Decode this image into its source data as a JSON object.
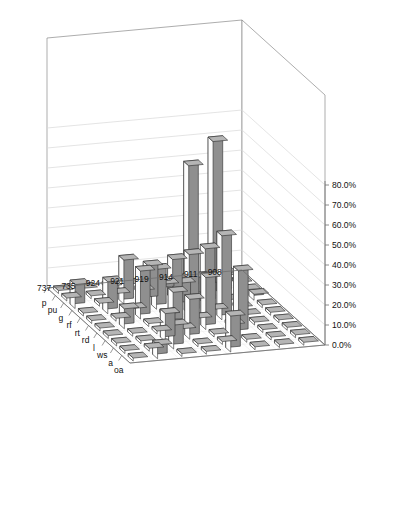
{
  "chart_data": {
    "type": "bar",
    "title": "",
    "subtitle": "",
    "xlabel": "",
    "ylabel": "",
    "zlabel": "",
    "projection": "3d",
    "grid": true,
    "legend_position": "none",
    "ylim": [
      0,
      80
    ],
    "ytick_labels": [
      "0.0%",
      "10.0%",
      "20.0%",
      "30.0%",
      "40.0%",
      "50.0%",
      "60.0%",
      "70.0%",
      "80.0%"
    ],
    "ytick_values": [
      0,
      10,
      20,
      30,
      40,
      50,
      60,
      70,
      80
    ],
    "categories": [
      "p",
      "pu",
      "g",
      "rf",
      "rt",
      "rd",
      "l",
      "ws",
      "a",
      "oa"
    ],
    "series": [
      {
        "name": "908",
        "values": [
          0.5,
          1.0,
          0.8,
          3.0,
          1.0,
          1.0,
          1.2,
          0.8,
          1.0,
          1.0
        ]
      },
      {
        "name": "911",
        "values": [
          0.8,
          73.0,
          11.0,
          1.0,
          1.2,
          1.0,
          0.8,
          1.0,
          1.2,
          1.0
        ]
      },
      {
        "name": "914",
        "values": [
          0.8,
          62.0,
          10.0,
          28.0,
          1.0,
          42.0,
          1.2,
          32.0,
          1.0,
          1.0
        ]
      },
      {
        "name": "919",
        "values": [
          0.8,
          4.0,
          20.0,
          12.0,
          30.0,
          2.0,
          26.0,
          1.2,
          1.0,
          18.0
        ]
      },
      {
        "name": "921",
        "values": [
          0.8,
          2.0,
          18.0,
          20.0,
          1.0,
          16.0,
          1.0,
          20.0,
          1.0,
          1.0
        ]
      },
      {
        "name": "924",
        "values": [
          0.8,
          1.0,
          22.0,
          1.2,
          24.0,
          1.0,
          1.0,
          14.0,
          12.0,
          1.0
        ]
      },
      {
        "name": "735",
        "values": [
          0.8,
          1.0,
          1.0,
          16.0,
          1.0,
          10.0,
          1.0,
          1.0,
          1.0,
          7.0
        ]
      },
      {
        "name": "737",
        "values": [
          0.8,
          1.0,
          12.0,
          1.0,
          1.0,
          1.0,
          1.0,
          1.0,
          1.0,
          1.0
        ]
      }
    ]
  },
  "colors": {
    "bar_top": "#b5b5b5",
    "bar_side": "#8f8f8f",
    "bar_front": "#fdfdfd",
    "outline": "#2b2b2b",
    "grid": "#d8d8d8",
    "axis": "#6e6e6e",
    "text": "#111111",
    "background": "#ffffff"
  }
}
